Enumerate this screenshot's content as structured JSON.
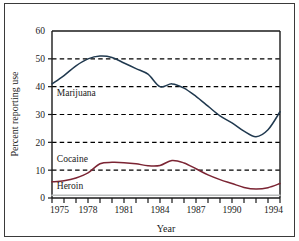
{
  "chart_data": {
    "type": "line",
    "title": "",
    "xlabel": "Year",
    "ylabel": "Percent reporting use",
    "xlim": [
      1975,
      1994
    ],
    "ylim": [
      0,
      60
    ],
    "grid": "horizontal-dashed",
    "legend_position": "inline-annotations",
    "x": [
      1975,
      1976,
      1977,
      1978,
      1979,
      1980,
      1981,
      1982,
      1983,
      1984,
      1985,
      1986,
      1987,
      1988,
      1989,
      1990,
      1991,
      1992,
      1993,
      1994
    ],
    "xticks": [
      1975,
      1976,
      1977,
      1978,
      1979,
      1980,
      1981,
      1982,
      1983,
      1984,
      1985,
      1986,
      1987,
      1988,
      1989,
      1990,
      1991,
      1992,
      1993,
      1994
    ],
    "xtick_labels": [
      "1975",
      "",
      "",
      "1978",
      "",
      "",
      "1981",
      "",
      "",
      "1984",
      "",
      "",
      "1987",
      "",
      "",
      "1990",
      "",
      "",
      "",
      "1994"
    ],
    "yticks": [
      0,
      10,
      20,
      30,
      40,
      50,
      60
    ],
    "ytick_labels": [
      "0",
      "10",
      "20",
      "30",
      "40",
      "50",
      "60"
    ],
    "series": [
      {
        "name": "Marijuana",
        "color": "#20394f",
        "label_x": 1975.4,
        "label_y": 36.5,
        "values": [
          41.0,
          44.0,
          47.5,
          50.0,
          51.0,
          50.5,
          48.5,
          46.5,
          44.5,
          40.0,
          41.0,
          39.5,
          36.5,
          33.0,
          29.5,
          27.0,
          24.0,
          22.0,
          24.5,
          31.0
        ]
      },
      {
        "name": "Cocaine",
        "color": "#7b2433",
        "label_x": 1975.4,
        "label_y": 13.0,
        "values": [
          5.8,
          6.2,
          7.2,
          9.0,
          12.3,
          12.8,
          12.7,
          12.3,
          11.6,
          11.7,
          13.5,
          12.6,
          10.5,
          8.3,
          6.6,
          5.2,
          3.8,
          3.2,
          3.7,
          5.2
        ]
      },
      {
        "name": "Heroin",
        "color": "#b9bcbb",
        "label_x": 1975.4,
        "label_y": 3.2,
        "values": [
          1.0,
          1.0,
          1.0,
          1.0,
          1.0,
          1.0,
          1.0,
          1.0,
          1.0,
          1.0,
          1.0,
          1.0,
          1.0,
          1.0,
          1.0,
          1.0,
          1.0,
          1.0,
          1.0,
          1.0
        ]
      }
    ]
  },
  "axes": {
    "y_title": "Percent reporting use",
    "x_title": "Year"
  },
  "colors": {
    "marijuana": "#20394f",
    "cocaine": "#7b2433",
    "heroin": "#b9bcbb",
    "frame": "#3a3a3a",
    "gridline": "#000000"
  }
}
